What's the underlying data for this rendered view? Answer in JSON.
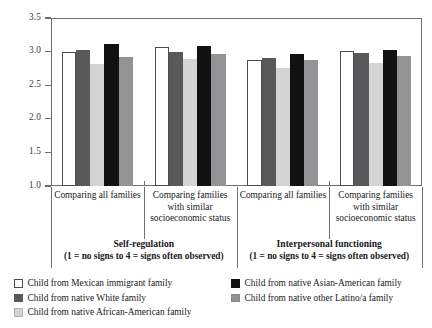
{
  "chart_data": {
    "type": "bar",
    "title": "",
    "xlabel": "",
    "ylabel": "",
    "ylim": [
      1.0,
      3.5
    ],
    "yticks": [
      "3.5",
      "3.0",
      "2.5",
      "2.0",
      "1.5",
      "1.0"
    ],
    "grid": false,
    "legend_position": "bottom",
    "categories": [
      "Comparing all families",
      "Comparing families with similar socioeconomic status",
      "Comparing all families",
      "Comparing families with similar socioeconomic status"
    ],
    "panels": [
      {
        "name": "Self-regulation",
        "scale_note": "(1 = no signs to 4 = signs often observed)",
        "groups": [
          "Comparing all families",
          "Comparing families with similar socioeconomic status"
        ]
      },
      {
        "name": "Interpersonal functioning",
        "scale_note": "(1 = no signs to 4 = signs often observed)",
        "groups": [
          "Comparing all families",
          "Comparing families with similar socioeconomic status"
        ]
      }
    ],
    "series": [
      {
        "name": "Child from Mexican immigrant family",
        "color": "#ffffff",
        "values": [
          3.0,
          3.07,
          2.88,
          3.01
        ]
      },
      {
        "name": "Child from native White family",
        "color": "#59595b",
        "values": [
          3.02,
          2.99,
          2.9,
          2.98
        ]
      },
      {
        "name": "Child from native African-American family",
        "color": "#d4d4d4",
        "values": [
          2.81,
          2.89,
          2.75,
          2.83
        ]
      },
      {
        "name": "Child from native Asian-American family",
        "color": "#111111",
        "values": [
          3.11,
          3.09,
          2.96,
          3.03
        ]
      },
      {
        "name": "Child from native other Latino/a family",
        "color": "#939396",
        "values": [
          2.92,
          2.97,
          2.88,
          2.93
        ]
      }
    ]
  },
  "legend": {
    "column_left": [
      "Child from Mexican immigrant family",
      "Child from native White family",
      "Child from native African-American family"
    ],
    "column_right": [
      "Child from native Asian-American family",
      "Child from native other Latino/a family"
    ]
  },
  "axis": {
    "y_labels": [
      "3.5",
      "3.0",
      "2.5",
      "2.0",
      "1.5",
      "1.0"
    ]
  }
}
